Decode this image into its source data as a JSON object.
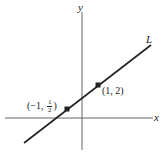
{
  "diagram": {
    "type": "coordinate-plane-line",
    "axes": {
      "x_label": "x",
      "y_label": "y"
    },
    "line": {
      "label": "L",
      "passes_through": [
        {
          "x": -1,
          "y": 0.5
        },
        {
          "x": 1,
          "y": 2
        }
      ]
    },
    "points": [
      {
        "label_prefix": "(−1, ",
        "label_frac_num": "1",
        "label_frac_den": "2",
        "label_suffix": ")",
        "x": -1,
        "y": 0.5
      },
      {
        "label": "(1, 2)",
        "x": 1,
        "y": 2
      }
    ]
  }
}
